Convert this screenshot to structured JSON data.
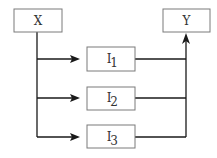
{
  "diagram": {
    "type": "flow",
    "nodes": [
      {
        "id": "X",
        "label": "X",
        "sub": ""
      },
      {
        "id": "I1",
        "label": "I",
        "sub": "1"
      },
      {
        "id": "I2",
        "label": "I",
        "sub": "2"
      },
      {
        "id": "I3",
        "label": "I",
        "sub": "3"
      },
      {
        "id": "Y",
        "label": "Y",
        "sub": ""
      }
    ],
    "edges": [
      {
        "from": "X",
        "to": "I1"
      },
      {
        "from": "X",
        "to": "I2"
      },
      {
        "from": "X",
        "to": "I3"
      },
      {
        "from": "I1",
        "to": "Y"
      },
      {
        "from": "I2",
        "to": "Y"
      },
      {
        "from": "I3",
        "to": "Y"
      }
    ],
    "colors": {
      "box_stroke": "#7a7a7a",
      "edge": "#1a1a1a",
      "text": "#333333"
    }
  }
}
